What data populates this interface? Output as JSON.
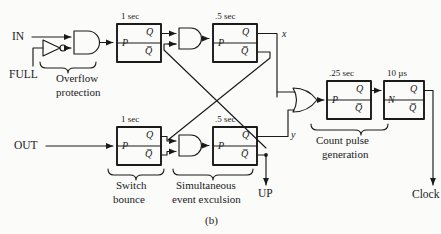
{
  "figure": {
    "caption": "(b)",
    "type": "logic-circuit-diagram"
  },
  "inputs": [
    {
      "id": "in",
      "label": "IN"
    },
    {
      "id": "full",
      "label": "FULL"
    },
    {
      "id": "out",
      "label": "OUT"
    }
  ],
  "outputs": [
    {
      "id": "up",
      "label": "UP"
    },
    {
      "id": "clock",
      "label": "Clock"
    }
  ],
  "signals": [
    {
      "id": "x",
      "label": "x"
    },
    {
      "id": "y",
      "label": "y"
    }
  ],
  "blocks": [
    {
      "id": "ff-top-1",
      "timing": "1 sec",
      "trigger": "P",
      "q": "Q",
      "qbar": "Q̅"
    },
    {
      "id": "ff-top-2",
      "timing": ".5 sec",
      "trigger": "P",
      "q": "Q",
      "qbar": "Q̅"
    },
    {
      "id": "ff-bot-1",
      "timing": "1 sec",
      "trigger": "P",
      "q": "Q",
      "qbar": "Q̅"
    },
    {
      "id": "ff-bot-2",
      "timing": ".5 sec",
      "trigger": "P",
      "q": "Q",
      "qbar": "Q̅"
    },
    {
      "id": "ff-count-1",
      "timing": ".25 sec",
      "trigger": "P",
      "q": "Q",
      "qbar": "Q̅"
    },
    {
      "id": "ff-count-2",
      "timing": "10 µs",
      "trigger": "N",
      "q": "Q",
      "qbar": "Q̅"
    }
  ],
  "gates": [
    {
      "id": "inverter-full",
      "type": "inverter"
    },
    {
      "id": "and-overflow",
      "type": "and"
    },
    {
      "id": "and-top",
      "type": "and"
    },
    {
      "id": "and-bottom",
      "type": "and"
    },
    {
      "id": "or-merge",
      "type": "or"
    }
  ],
  "annotations": [
    {
      "id": "overflow",
      "line1": "Overflow",
      "line2": "protection"
    },
    {
      "id": "switch",
      "line1": "Switch",
      "line2": "bounce"
    },
    {
      "id": "simultaneous",
      "line1": "Simultaneous",
      "line2": "event exculsion"
    },
    {
      "id": "countpulse",
      "line1": "Count pulse",
      "line2": "generation"
    }
  ],
  "colors": {
    "ink": "#1a1a1a",
    "paper": "#fbfbfa",
    "wire": "#2a2a2a"
  }
}
